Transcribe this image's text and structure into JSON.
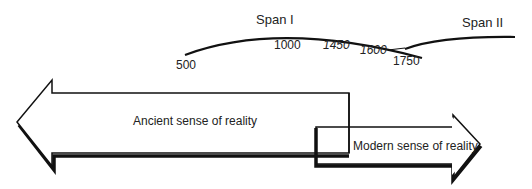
{
  "timeline": {
    "span1_label": "Span I",
    "span2_label": "Span II",
    "years": {
      "y500": "500",
      "y1000": "1000",
      "y1450": "1450",
      "y1600": "1600",
      "y1750": "1750"
    }
  },
  "arrows": {
    "ancient": "Ancient sense of reality",
    "modern": "Modern sense of reality"
  },
  "colors": {
    "stroke": "#111111",
    "text": "#222222"
  }
}
